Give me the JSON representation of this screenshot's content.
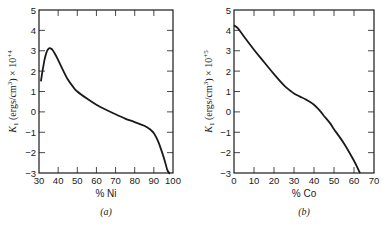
{
  "chart_data": [
    {
      "type": "line",
      "panel_label": "(a)",
      "title": "",
      "xlabel": "% Ni",
      "ylabel": "K1 (ergs/cm3) × 10+4",
      "ylabel_parts": {
        "k": "K",
        "sub": "1",
        "units": " (ergs/cm",
        "sup3": "3",
        "tail": ") × 10",
        "exp": "+4"
      },
      "xlim": [
        30,
        100
      ],
      "ylim": [
        -3,
        5
      ],
      "xticks": [
        30,
        40,
        50,
        60,
        70,
        80,
        90,
        100
      ],
      "yticks": [
        -3,
        -2,
        -1,
        0,
        1,
        2,
        3,
        4,
        5
      ],
      "grid": false,
      "series": [
        {
          "name": "K1 vs % Ni",
          "x": [
            31,
            32,
            33,
            34,
            35,
            36,
            37,
            38,
            40,
            42,
            45,
            48,
            50,
            55,
            60,
            65,
            70,
            75,
            80,
            85,
            88,
            90,
            92,
            94,
            96,
            97,
            98,
            98.5
          ],
          "y": [
            1.5,
            2.1,
            2.6,
            2.95,
            3.1,
            3.12,
            3.05,
            2.9,
            2.55,
            2.15,
            1.6,
            1.2,
            1.0,
            0.65,
            0.35,
            0.1,
            -0.12,
            -0.33,
            -0.5,
            -0.68,
            -0.85,
            -1.05,
            -1.4,
            -1.9,
            -2.5,
            -2.85,
            -3.0,
            -3.0
          ]
        }
      ]
    },
    {
      "type": "line",
      "panel_label": "(b)",
      "title": "",
      "xlabel": "% Co",
      "ylabel": "K1 (ergs/cm3) × 10+5",
      "ylabel_parts": {
        "k": "K",
        "sub": "1",
        "units": " (ergs/cm",
        "sup3": "3",
        "tail": ") × 10",
        "exp": "+5"
      },
      "xlim": [
        0,
        70
      ],
      "ylim": [
        -3,
        5
      ],
      "xticks": [
        0,
        10,
        20,
        30,
        40,
        50,
        60,
        70
      ],
      "yticks": [
        -3,
        -2,
        -1,
        0,
        1,
        2,
        3,
        4,
        5
      ],
      "grid": false,
      "series": [
        {
          "name": "K1 vs % Co",
          "x": [
            0,
            2,
            5,
            10,
            15,
            20,
            25,
            28,
            30,
            33,
            36,
            40,
            43,
            45,
            48,
            50,
            55,
            60,
            63
          ],
          "y": [
            4.25,
            4.1,
            3.7,
            3.05,
            2.45,
            1.85,
            1.3,
            1.05,
            0.9,
            0.75,
            0.6,
            0.35,
            0.05,
            -0.2,
            -0.55,
            -0.85,
            -1.55,
            -2.4,
            -3.0
          ]
        }
      ]
    }
  ],
  "captions": {
    "a": "(a)",
    "b": "(b)"
  },
  "colors": {
    "line": "#1a1a1a",
    "background": "#ffffff"
  }
}
